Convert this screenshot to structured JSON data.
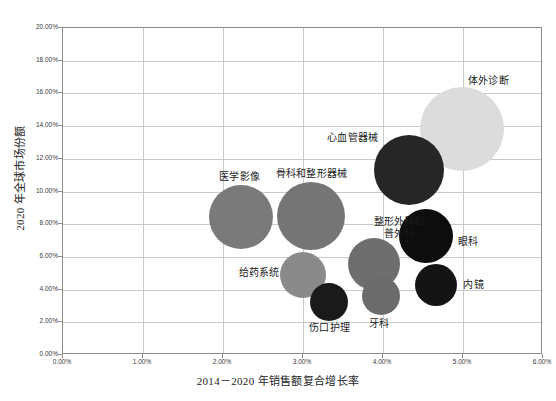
{
  "chart_data": {
    "type": "scatter",
    "title": "",
    "xlabel": "2014－2020 年销售额复合增长率",
    "ylabel": "2020 年全球市场份额",
    "xlim": [
      0,
      6
    ],
    "ylim": [
      0,
      20
    ],
    "xtick_labels": [
      "0.00%",
      "1.00%",
      "2.00%",
      "3.00%",
      "4.00%",
      "5.00%",
      "6.00%"
    ],
    "ytick_labels": [
      "0.00%",
      "2.00%",
      "4.00%",
      "6.00%",
      "8.00%",
      "10.00%",
      "12.00%",
      "14.00%",
      "16.00%",
      "18.00%",
      "20.00%"
    ],
    "grid": true,
    "legend": "none",
    "points": [
      {
        "label": "体外诊断",
        "x": 5.0,
        "y": 13.76,
        "r": 42,
        "color": "#dcdcdc",
        "label_dx": 6,
        "label_dy": -54,
        "lines": 1
      },
      {
        "label": "心血管器械",
        "x": 4.34,
        "y": 11.25,
        "r": 35,
        "color": "#262626",
        "label_dx": -82,
        "label_dy": -38,
        "lines": 1
      },
      {
        "label": "医学影像",
        "x": 2.24,
        "y": 8.38,
        "r": 32,
        "color": "#7a7a7a",
        "label_dx": -22,
        "label_dy": -46,
        "lines": 1
      },
      {
        "label": "骨科和整形器械",
        "x": 3.11,
        "y": 8.44,
        "r": 34,
        "color": "#757575",
        "label_dx": -35,
        "label_dy": -48,
        "lines": 1
      },
      {
        "label": "整形外科和普外科",
        "x": 3.9,
        "y": 5.5,
        "r": 26,
        "color": "#6e6e6e",
        "label_dx": -3,
        "label_dy": -48,
        "lines": 2
      },
      {
        "label": "眼科",
        "x": 4.55,
        "y": 7.22,
        "r": 27,
        "color": "#0d0d0d",
        "label_dx": 32,
        "label_dy": 0,
        "lines": 1
      },
      {
        "label": "内镜",
        "x": 4.68,
        "y": 4.22,
        "r": 21,
        "color": "#141414",
        "label_dx": 27,
        "label_dy": -6,
        "lines": 1
      },
      {
        "label": "给药系统",
        "x": 3.01,
        "y": 4.83,
        "r": 23,
        "color": "#8a8a8a",
        "label_dx": -64,
        "label_dy": -8,
        "lines": 1
      },
      {
        "label": "伤口护理",
        "x": 3.34,
        "y": 3.18,
        "r": 19,
        "color": "#1a1a1a",
        "label_dx": -20,
        "label_dy": 20,
        "lines": 1
      },
      {
        "label": "牙科",
        "x": 3.99,
        "y": 3.55,
        "r": 19,
        "color": "#6b6b6b",
        "label_dx": -12,
        "label_dy": 22,
        "lines": 1
      }
    ]
  },
  "axes": {
    "x_origin_px": 62,
    "y_origin_px": 354,
    "px_per_x_unit": 80,
    "px_per_y_unit": 16.35
  }
}
